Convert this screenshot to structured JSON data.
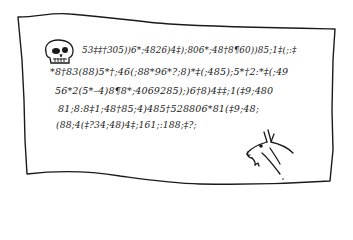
{
  "illustration": {
    "subject": "cipher parchment",
    "colors": {
      "ink": "#1a1a1a",
      "paper": "#ffffff"
    },
    "icons": {
      "skull": "skull-icon",
      "kid": "goat-kid-icon"
    }
  },
  "cipher": {
    "lines": [
      "53‡‡†305))6*;4826)4‡);806*;48†8¶60))85;1‡(;:‡",
      "*8†83(88)5*†;46(;88*96*?;8)*‡(;485);5*†2:*‡(;49",
      "56*2(5*–4)8¶8*;4069285);)6†8)4‡‡;1(‡9;480",
      "81;8:8‡1;48†85;4)485†528806*81(‡9;48;",
      "(88;4(‡?34;48)4‡;161;:188;‡?;"
    ]
  }
}
